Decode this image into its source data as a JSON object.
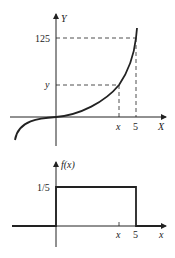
{
  "top_graph": {
    "y_axis_label": "Y",
    "x_axis_label": "X",
    "y_tick_labels": [
      "125",
      "y"
    ],
    "x_tick_labels": [
      "x",
      "5"
    ],
    "curve": "cubic Y = X^3"
  },
  "bottom_graph": {
    "y_axis_label": "f(x)",
    "x_axis_label": "x",
    "y_tick_labels": [
      "1/5"
    ],
    "x_tick_labels": [
      "x",
      "5"
    ],
    "shape": "uniform density on [0,5] with height 1/5"
  },
  "colors": {
    "ink": "#222222",
    "background": "#ffffff"
  }
}
